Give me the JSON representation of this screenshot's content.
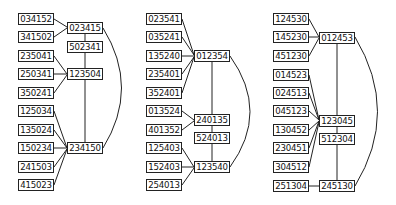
{
  "groups": [
    {
      "left": [
        "034152",
        "341502",
        "235041",
        "250341",
        "350241",
        "125034",
        "135024",
        "150234",
        "241503",
        "415023"
      ],
      "middle": [
        "023415",
        "502341",
        "123504",
        "234150"
      ]
    },
    {
      "left": [
        "023541",
        "035241",
        "135240",
        "235401",
        "352401",
        "013524",
        "401352",
        "125403",
        "152403",
        "254013"
      ],
      "middle": [
        "012354",
        "240135",
        "524013",
        "123540"
      ]
    },
    {
      "left": [
        "124530",
        "145230",
        "451230",
        "014523",
        "024513",
        "045123",
        "130452",
        "230451",
        "304512",
        "251304"
      ],
      "middle": [
        "012453",
        "123045",
        "512304",
        "245130"
      ]
    }
  ]
}
